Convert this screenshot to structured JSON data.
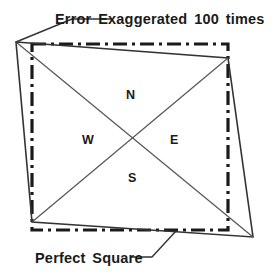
{
  "figure": {
    "title_top": "Error Exaggerated 100 times",
    "title_bottom": "Perfect Square",
    "quadrant_labels": {
      "north": "N",
      "west": "W",
      "east": "E",
      "south": "S"
    },
    "colors": {
      "ink": "#1a1a1a",
      "background": "#ffffff",
      "reference_square_stroke": "#1a1a1a",
      "distorted_shape_stroke": "#333333",
      "diagonal_stroke": "#555555",
      "leader_stroke": "#333333"
    },
    "geometry": {
      "canvas_width": 277,
      "canvas_height": 278,
      "perfect_square": {
        "name": "Perfect Square",
        "style": "dash-dot",
        "stroke_width": 3.2,
        "corners": [
          {
            "label": "top-left",
            "x": 32,
            "y": 44
          },
          {
            "label": "top-right",
            "x": 228,
            "y": 44
          },
          {
            "label": "bottom-right",
            "x": 228,
            "y": 230
          },
          {
            "label": "bottom-left",
            "x": 32,
            "y": 230
          }
        ]
      },
      "distorted_quadrilateral": {
        "name": "Error Exaggerated 100 times",
        "style": "solid",
        "stroke_width": 1.6,
        "corners": [
          {
            "label": "top-left",
            "x": 16,
            "y": 42
          },
          {
            "label": "top-right",
            "x": 228,
            "y": 58
          },
          {
            "label": "bottom-right",
            "x": 253,
            "y": 237
          },
          {
            "label": "bottom-left",
            "x": 32,
            "y": 222
          }
        ]
      },
      "diagonals": {
        "style": "solid",
        "stroke_width": 1.2,
        "intersection": {
          "x": 135,
          "y": 137
        },
        "lines": [
          {
            "name": "nw-se",
            "x1": 16,
            "y1": 42,
            "x2": 253,
            "y2": 237
          },
          {
            "name": "ne-sw",
            "x1": 228,
            "y1": 58,
            "x2": 32,
            "y2": 222
          }
        ]
      },
      "leaders": [
        {
          "name": "top-caption-leader",
          "points": "112,19 72,19 16,42",
          "stroke_width": 1.4
        },
        {
          "name": "bottom-caption-leader",
          "points": "130,257 152,257 176,231",
          "stroke_width": 1.4
        }
      ]
    }
  }
}
